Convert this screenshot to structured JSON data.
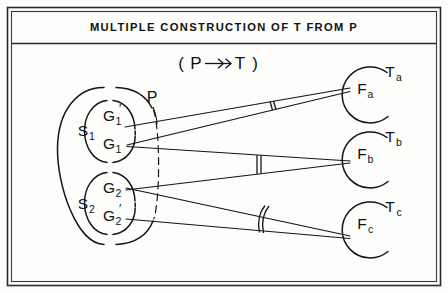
{
  "figure": {
    "title": "MULTIPLE CONSTRUCTION OF T FROM P",
    "subtitle_open": "(",
    "subtitle_source": "P",
    "subtitle_arrow": "arrow-double-head-icon",
    "subtitle_target": "T",
    "subtitle_close": ")"
  },
  "source_domain": {
    "label": "P",
    "label_name": "domain-label-P",
    "subsets": [
      {
        "label": "S",
        "sub": "1",
        "name": "subset-s1",
        "elements": [
          {
            "base": "G",
            "sub": "1",
            "prime": "′",
            "name": "node-g1-prime"
          },
          {
            "base": "G",
            "sub": "1",
            "prime": "",
            "name": "node-g1"
          }
        ]
      },
      {
        "label": "S",
        "sub": "2",
        "name": "subset-s2",
        "elements": [
          {
            "base": "G",
            "sub": "2",
            "prime": "",
            "name": "node-g2"
          },
          {
            "base": "G",
            "sub": "2",
            "prime": "′",
            "name": "node-g2-prime"
          }
        ]
      }
    ]
  },
  "targets": [
    {
      "t_base": "T",
      "t_sub": "a",
      "f_base": "F",
      "f_sub": "a",
      "name": "target-a"
    },
    {
      "t_base": "T",
      "t_sub": "b",
      "f_base": "F",
      "f_sub": "b",
      "name": "target-b"
    },
    {
      "t_base": "T",
      "t_sub": "c",
      "f_base": "F",
      "f_sub": "c",
      "name": "target-c"
    }
  ],
  "mappings": [
    {
      "from": "G1-prime",
      "to": "Fa",
      "name": "edge-g1prime-to-fa"
    },
    {
      "from": "G1",
      "to": "Fa",
      "name": "edge-g1-to-fa"
    },
    {
      "from": "G1",
      "to": "Fb",
      "name": "edge-g1-to-fb"
    },
    {
      "from": "G2",
      "to": "Fb",
      "name": "edge-g2-to-fb"
    },
    {
      "from": "G2",
      "to": "Fc",
      "name": "edge-g2-to-fc"
    },
    {
      "from": "G2-prime",
      "to": "Fc",
      "name": "edge-g2prime-to-fc"
    }
  ],
  "tick_marks": [
    {
      "pair": "Fa",
      "style": "double-straight",
      "name": "tick-pair-fa"
    },
    {
      "pair": "Fb",
      "style": "double-straight",
      "name": "tick-pair-fb"
    },
    {
      "pair": "Fc",
      "style": "double-curved",
      "name": "tick-pair-fc"
    }
  ],
  "colors": {
    "ink": "#141414",
    "frame": "#2a2a2a",
    "background": "#fdfdfb"
  }
}
